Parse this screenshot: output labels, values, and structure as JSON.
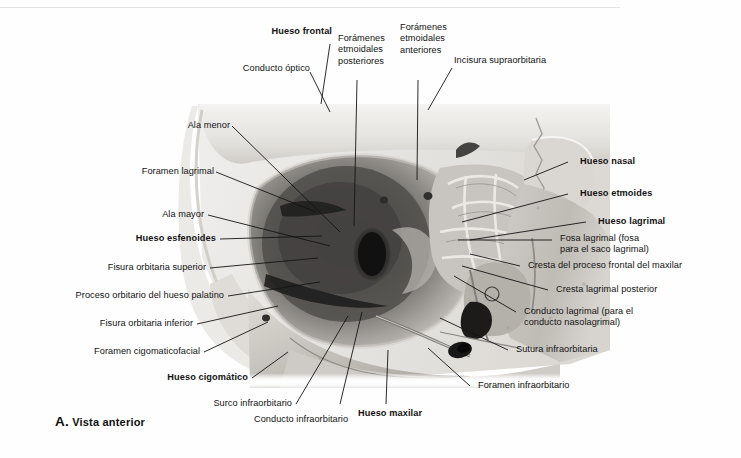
{
  "figure": {
    "caption_letter": "A.",
    "caption_text": "Vista anterior",
    "view": "Vista anterior",
    "image_kind": "grayscale-photograph"
  },
  "labels": {
    "conducto_optico": "Conducto óptico",
    "hueso_frontal": "Hueso frontal",
    "foramenes_etmoidales_posteriores": "Forámenes\netmoidales\nposteriores",
    "foramenes_etmoidales_anteriores": "Forámenes\netmoidales\nanteriores",
    "incisura_supraorbitaria": "Incisura supraorbitaria",
    "ala_menor": "Ala menor",
    "foramen_lagrimal": "Foramen lagrimal",
    "ala_mayor": "Ala mayor",
    "hueso_esfenoides": "Hueso esfenoides",
    "fisura_orbitaria_superior": "Fisura orbitaria superior",
    "proceso_orbitario_hueso_palatino": "Proceso orbitario del hueso palatino",
    "fisura_orbitaria_inferior": "Fisura orbitaria inferior",
    "foramen_cigomaticofacial": "Foramen cigomaticofacial",
    "hueso_cigomatico": "Hueso cigomático",
    "surco_infraorbitario": "Surco infraorbitario",
    "conducto_infraorbitario": "Conducto infraorbitario",
    "hueso_maxilar": "Hueso maxilar",
    "hueso_nasal": "Hueso nasal",
    "hueso_etmoides": "Hueso etmoides",
    "hueso_lagrimal": "Hueso lagrimal",
    "fosa_lagrimal": "Fosa lagrimal (fosa\npara el saco lagrimal)",
    "cresta_proceso_frontal_maxilar": "Cresta del proceso frontal del maxilar",
    "cresta_lagrimal_posterior": "Cresta lagrimal posterior",
    "conducto_lagrimal": "Conducto lagrimal (para el\nconducto nasolagrimal)",
    "sutura_infraorbitaria": "Sutura infraorbitaria",
    "foramen_infraorbitario": "Foramen infraorbitario"
  },
  "colors": {
    "text": "#131313",
    "leader": "#141414",
    "page_background": "#fefefe",
    "rule": "#e3e3e3",
    "bone_light": "#e8e6e2",
    "bone_mid": "#b9b6b2",
    "bone_dark": "#6e6c6a",
    "orbit_shadow": "#3a3a3a",
    "orbit_deep": "#111111"
  }
}
